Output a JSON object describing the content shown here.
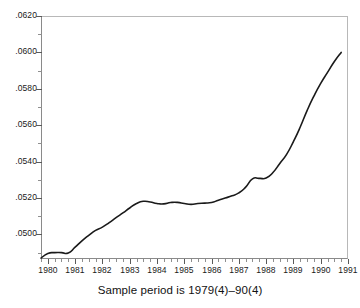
{
  "caption": "Sample period is 1979(4)–90(4)",
  "chart_data": {
    "type": "line",
    "title": "",
    "subtitle": "",
    "caption": "Sample period is 1979(4)–90(4)",
    "xlabel": "",
    "ylabel": "",
    "xlim": [
      1979.75,
      1991.0
    ],
    "ylim": [
      0.04865,
      0.062
    ],
    "grid": false,
    "legend": null,
    "line_color": "#1a1a1a",
    "y_tick_labels": [
      ".0620",
      ".0600",
      ".0580",
      ".0560",
      ".0540",
      ".0520",
      ".0500"
    ],
    "y_tick_values": [
      0.062,
      0.06,
      0.058,
      0.056,
      0.054,
      0.052,
      0.05
    ],
    "y_minor_step": 0.001,
    "x_tick_labels": [
      "1980",
      "1981",
      "1982",
      "1983",
      "1984",
      "1985",
      "1986",
      "1987",
      "1988",
      "1989",
      "1990",
      "1991"
    ],
    "x_tick_values": [
      1980,
      1981,
      1982,
      1983,
      1984,
      1985,
      1986,
      1987,
      1988,
      1989,
      1990,
      1991
    ],
    "x_minor_step": 0.25,
    "series": [
      {
        "name": "series-1",
        "x": [
          1979.75,
          1980.0,
          1980.25,
          1980.5,
          1980.75,
          1981.0,
          1981.25,
          1981.5,
          1981.75,
          1982.0,
          1982.25,
          1982.5,
          1982.75,
          1983.0,
          1983.25,
          1983.5,
          1983.75,
          1984.0,
          1984.25,
          1984.5,
          1984.75,
          1985.0,
          1985.25,
          1985.5,
          1985.75,
          1986.0,
          1986.25,
          1986.5,
          1986.75,
          1987.0,
          1987.25,
          1987.5,
          1987.75,
          1988.0,
          1988.25,
          1988.5,
          1988.75,
          1989.0,
          1989.25,
          1989.5,
          1989.75,
          1990.0,
          1990.25,
          1990.5,
          1990.75
        ],
        "values": [
          0.0487,
          0.04895,
          0.049,
          0.049,
          0.04898,
          0.0493,
          0.04965,
          0.04995,
          0.05022,
          0.0504,
          0.05065,
          0.05092,
          0.05118,
          0.05145,
          0.0517,
          0.05182,
          0.05178,
          0.0517,
          0.05168,
          0.05175,
          0.05176,
          0.0517,
          0.05165,
          0.0517,
          0.05172,
          0.05175,
          0.05188,
          0.052,
          0.05212,
          0.05228,
          0.0526,
          0.05305,
          0.05308,
          0.0531,
          0.0534,
          0.0539,
          0.0544,
          0.0551,
          0.0559,
          0.0568,
          0.0576,
          0.0583,
          0.0589,
          0.0595,
          0.06
        ]
      }
    ]
  }
}
